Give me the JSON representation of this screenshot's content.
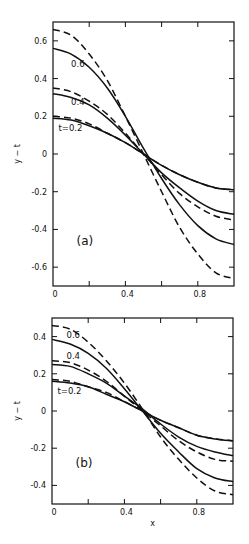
{
  "chart_data": [
    {
      "type": "line",
      "panel_label": "(a)",
      "xlabel": "",
      "ylabel": "y − t",
      "xlim": [
        0,
        1
      ],
      "ylim": [
        -0.7,
        0.7
      ],
      "x_ticks": [
        0,
        0.2,
        0.4,
        0.6,
        0.8,
        1.0
      ],
      "x_tick_labels": [
        "0",
        "",
        "0.4",
        "",
        "0.8",
        ""
      ],
      "y_ticks": [
        -0.6,
        -0.4,
        -0.2,
        0,
        0.2,
        0.4,
        0.6
      ],
      "y_tick_labels": [
        "-0.6",
        "-0.4",
        "-0.2",
        "0",
        "0.2",
        "0.4",
        "0.6"
      ],
      "grid": false,
      "x": [
        0,
        0.1,
        0.2,
        0.3,
        0.4,
        0.5,
        0.6,
        0.7,
        0.8,
        0.9,
        1.0
      ],
      "curve_labels": [
        {
          "text": "0.6",
          "x": 0.1,
          "y": 0.46
        },
        {
          "text": "0.4",
          "x": 0.1,
          "y": 0.26
        },
        {
          "text": "t=0.2",
          "x": 0.03,
          "y": 0.12
        }
      ],
      "series": [
        {
          "name": "t=0.2 solid",
          "t": 0.2,
          "style": "solid",
          "values": [
            0.19,
            0.18,
            0.15,
            0.11,
            0.06,
            0.0,
            -0.06,
            -0.11,
            -0.15,
            -0.18,
            -0.19
          ]
        },
        {
          "name": "t=0.2 dashed",
          "t": 0.2,
          "style": "dashed",
          "values": [
            0.2,
            0.19,
            0.16,
            0.11,
            0.06,
            0.0,
            -0.06,
            -0.11,
            -0.15,
            -0.18,
            -0.19
          ]
        },
        {
          "name": "t=0.4 solid",
          "t": 0.4,
          "style": "solid",
          "values": [
            0.32,
            0.3,
            0.26,
            0.19,
            0.1,
            0.0,
            -0.1,
            -0.18,
            -0.25,
            -0.3,
            -0.32
          ]
        },
        {
          "name": "t=0.4 dashed",
          "t": 0.4,
          "style": "dashed",
          "values": [
            0.35,
            0.33,
            0.28,
            0.21,
            0.11,
            0.0,
            -0.11,
            -0.21,
            -0.28,
            -0.33,
            -0.35
          ]
        },
        {
          "name": "t=0.6 solid",
          "t": 0.6,
          "style": "solid",
          "values": [
            0.56,
            0.53,
            0.46,
            0.35,
            0.2,
            0.03,
            -0.13,
            -0.27,
            -0.38,
            -0.45,
            -0.48
          ]
        },
        {
          "name": "t=0.6 dashed",
          "t": 0.6,
          "style": "dashed",
          "values": [
            0.66,
            0.63,
            0.53,
            0.39,
            0.2,
            0.0,
            -0.2,
            -0.39,
            -0.53,
            -0.63,
            -0.66
          ]
        }
      ]
    },
    {
      "type": "line",
      "panel_label": "(b)",
      "xlabel": "x",
      "ylabel": "y − t",
      "xlim": [
        0,
        1
      ],
      "ylim": [
        -0.5,
        0.5
      ],
      "x_ticks": [
        0,
        0.2,
        0.4,
        0.6,
        0.8,
        1.0
      ],
      "x_tick_labels": [
        "0",
        "",
        "0.4",
        "",
        "0.8",
        ""
      ],
      "y_ticks": [
        -0.4,
        -0.2,
        0,
        0.2,
        0.4
      ],
      "y_tick_labels": [
        "-0.4",
        "-0.2",
        "0",
        "0.2",
        "0.4"
      ],
      "grid": false,
      "x": [
        0,
        0.1,
        0.2,
        0.3,
        0.4,
        0.5,
        0.6,
        0.7,
        0.8,
        0.9,
        1.0
      ],
      "curve_labels": [
        {
          "text": "0.6",
          "x": 0.08,
          "y": 0.39
        },
        {
          "text": "0.4",
          "x": 0.08,
          "y": 0.28
        },
        {
          "text": "t=0.2",
          "x": 0.03,
          "y": 0.09
        }
      ],
      "series": [
        {
          "name": "t=0.2 solid",
          "t": 0.2,
          "style": "solid",
          "values": [
            0.16,
            0.15,
            0.13,
            0.09,
            0.05,
            0.0,
            -0.05,
            -0.09,
            -0.13,
            -0.15,
            -0.16
          ]
        },
        {
          "name": "t=0.2 dashed",
          "t": 0.2,
          "style": "dashed",
          "values": [
            0.17,
            0.16,
            0.13,
            0.1,
            0.05,
            0.0,
            -0.05,
            -0.09,
            -0.13,
            -0.15,
            -0.16
          ]
        },
        {
          "name": "t=0.4 solid",
          "t": 0.4,
          "style": "solid",
          "values": [
            0.25,
            0.24,
            0.2,
            0.15,
            0.08,
            0.01,
            -0.07,
            -0.14,
            -0.19,
            -0.22,
            -0.24
          ]
        },
        {
          "name": "t=0.4 dashed",
          "t": 0.4,
          "style": "dashed",
          "values": [
            0.27,
            0.26,
            0.22,
            0.16,
            0.08,
            0.0,
            -0.08,
            -0.16,
            -0.22,
            -0.26,
            -0.27
          ]
        },
        {
          "name": "t=0.6 solid",
          "t": 0.6,
          "style": "solid",
          "values": [
            0.385,
            0.36,
            0.31,
            0.23,
            0.12,
            0.0,
            -0.12,
            -0.22,
            -0.31,
            -0.36,
            -0.38
          ]
        },
        {
          "name": "t=0.6 dashed",
          "t": 0.6,
          "style": "dashed",
          "values": [
            0.46,
            0.44,
            0.37,
            0.27,
            0.15,
            0.01,
            -0.14,
            -0.26,
            -0.36,
            -0.43,
            -0.45
          ]
        }
      ]
    }
  ]
}
